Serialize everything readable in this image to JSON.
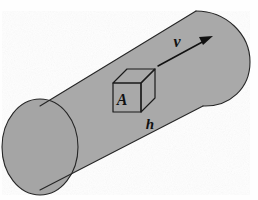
{
  "figure": {
    "kind": "physics-diagram",
    "width": 258,
    "height": 200,
    "background_color": "#fefefe"
  },
  "colors": {
    "cylinder_fill": "#a9a9a9",
    "cylinder_endcap_fill": "#a5a5a5",
    "outline_stroke": "#262626",
    "cube_stroke": "#1a1a1a",
    "arrow_color": "#111111",
    "label_color": "#111111"
  },
  "labels": {
    "area": "A",
    "height": "h",
    "velocity": "v"
  },
  "cylinder": {
    "name": "tilted-cylinder",
    "axis_direction": "lower-left to upper-right",
    "end_cap": "ellipse",
    "far_end": "rounded-cap"
  },
  "cube": {
    "name": "volume-element",
    "front_face_label": "A",
    "depth_label": "h",
    "faces": [
      "front",
      "top",
      "right"
    ]
  },
  "arrow": {
    "name": "velocity-arrow",
    "label": "v",
    "points_toward": "upper-right",
    "start": [
      158,
      66
    ],
    "end": [
      212,
      37
    ]
  }
}
